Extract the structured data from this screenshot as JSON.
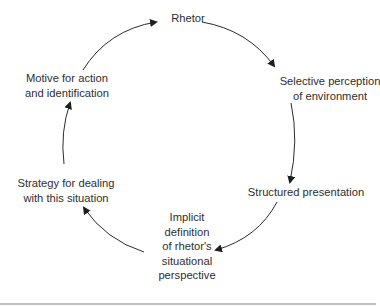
{
  "diagram": {
    "type": "cycle",
    "nodes": [
      {
        "id": "rhetor",
        "lines": [
          "Rhetor"
        ]
      },
      {
        "id": "selective",
        "lines": [
          "Selective perception",
          "of environment"
        ]
      },
      {
        "id": "structured",
        "lines": [
          "Structured presentation"
        ]
      },
      {
        "id": "implicit",
        "lines": [
          "Implicit",
          "definition",
          "of rhetor's",
          "situational",
          "perspective"
        ]
      },
      {
        "id": "strategy",
        "lines": [
          "Strategy for dealing",
          "with this situation"
        ]
      },
      {
        "id": "motive",
        "lines": [
          "Motive for action",
          "and identification"
        ]
      }
    ],
    "edges": [
      {
        "from": "rhetor",
        "to": "selective"
      },
      {
        "from": "selective",
        "to": "structured"
      },
      {
        "from": "structured",
        "to": "implicit"
      },
      {
        "from": "implicit",
        "to": "strategy"
      },
      {
        "from": "strategy",
        "to": "motive"
      },
      {
        "from": "motive",
        "to": "rhetor"
      }
    ],
    "colors": {
      "stroke": "#2b2b2b",
      "text": "#2e2e2e",
      "background": "#ffffff"
    }
  }
}
